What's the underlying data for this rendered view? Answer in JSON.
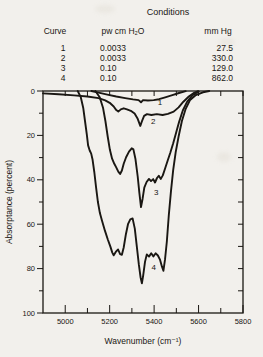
{
  "table": {
    "title": "Conditions",
    "headers": {
      "curve": "Curve",
      "pw": "pw cm H₂O",
      "mm_hg": "mm Hg"
    },
    "rows": [
      {
        "curve": "1",
        "pw": "0.0033",
        "mm_hg": "27.5"
      },
      {
        "curve": "2",
        "pw": "0.0033",
        "mm_hg": "330.0"
      },
      {
        "curve": "3",
        "pw": "0.10",
        "mm_hg": "129.0"
      },
      {
        "curve": "4",
        "pw": "0.10",
        "mm_hg": "862.0"
      }
    ]
  },
  "chart_data": {
    "type": "line",
    "title": "",
    "xlabel": "Wavenumber (cm⁻¹)",
    "ylabel": "Absorptance (percent)",
    "xlim": [
      4900,
      5800
    ],
    "ylim": [
      0,
      100
    ],
    "y_axis_inverted": true,
    "grid": false,
    "legend": "curve numbers annotated on plot",
    "x_ticks_major": [
      5000,
      5200,
      5400,
      5600,
      5800
    ],
    "x_ticks_minor": [
      5100,
      5300,
      5500,
      5700
    ],
    "y_ticks_major": [
      0,
      20,
      40,
      60,
      80,
      100
    ],
    "y_ticks_minor": [
      10,
      30,
      50,
      70,
      90
    ],
    "ink_color": "#1a1713",
    "series": [
      {
        "name": "1",
        "label_pos": [
          5426,
          5.0
        ],
        "points": [
          [
            5118,
            0
          ],
          [
            5150,
            0.7
          ],
          [
            5190,
            1.6
          ],
          [
            5230,
            2.5
          ],
          [
            5270,
            3.2
          ],
          [
            5305,
            3.8
          ],
          [
            5330,
            4.1
          ],
          [
            5341,
            5.1
          ],
          [
            5350,
            4.1
          ],
          [
            5372,
            4.3
          ],
          [
            5398,
            4.1
          ],
          [
            5422,
            3.7
          ],
          [
            5450,
            2.9
          ],
          [
            5482,
            1.9
          ],
          [
            5512,
            0.9
          ],
          [
            5542,
            0.1
          ]
        ]
      },
      {
        "name": "2",
        "label_pos": [
          5396,
          13.6
        ],
        "points": [
          [
            4900,
            1.1
          ],
          [
            4970,
            1.5
          ],
          [
            5040,
            2.0
          ],
          [
            5100,
            2.5
          ],
          [
            5150,
            3.2
          ],
          [
            5180,
            4.2
          ],
          [
            5200,
            5.3
          ],
          [
            5218,
            7.0
          ],
          [
            5230,
            8.6
          ],
          [
            5239,
            9.3
          ],
          [
            5250,
            8.3
          ],
          [
            5263,
            7.8
          ],
          [
            5278,
            8.3
          ],
          [
            5295,
            8.9
          ],
          [
            5312,
            10.2
          ],
          [
            5326,
            12.5
          ],
          [
            5338,
            15.7
          ],
          [
            5347,
            13.2
          ],
          [
            5355,
            11.2
          ],
          [
            5368,
            10.4
          ],
          [
            5388,
            10.8
          ],
          [
            5412,
            10.4
          ],
          [
            5438,
            10.8
          ],
          [
            5462,
            10.3
          ],
          [
            5488,
            9.3
          ],
          [
            5510,
            7.4
          ],
          [
            5532,
            4.8
          ],
          [
            5556,
            2.5
          ],
          [
            5580,
            0.8
          ],
          [
            5598,
            0.1
          ]
        ]
      },
      {
        "name": "3",
        "label_pos": [
          5409,
          45.5
        ],
        "points": [
          [
            5136,
            0
          ],
          [
            5155,
            2.8
          ],
          [
            5170,
            7.5
          ],
          [
            5181,
            13.5
          ],
          [
            5191,
            20.5
          ],
          [
            5201,
            26.5
          ],
          [
            5211,
            30.5
          ],
          [
            5221,
            32.8
          ],
          [
            5229,
            34.3
          ],
          [
            5239,
            36.3
          ],
          [
            5247,
            37.4
          ],
          [
            5255,
            35.8
          ],
          [
            5263,
            32.8
          ],
          [
            5274,
            29.8
          ],
          [
            5287,
            27.3
          ],
          [
            5299,
            25.8
          ],
          [
            5307,
            26.3
          ],
          [
            5316,
            30.5
          ],
          [
            5326,
            38.5
          ],
          [
            5334,
            46
          ],
          [
            5341,
            52.3
          ],
          [
            5348,
            48.5
          ],
          [
            5356,
            43.5
          ],
          [
            5366,
            41
          ],
          [
            5377,
            39.6
          ],
          [
            5386,
            40.6
          ],
          [
            5396,
            39.7
          ],
          [
            5404,
            41.2
          ],
          [
            5413,
            39.2
          ],
          [
            5421,
            38.2
          ],
          [
            5430,
            39.6
          ],
          [
            5439,
            38
          ],
          [
            5449,
            35
          ],
          [
            5461,
            31.3
          ],
          [
            5473,
            27.8
          ],
          [
            5486,
            23.5
          ],
          [
            5499,
            18.8
          ],
          [
            5513,
            13.8
          ],
          [
            5529,
            8.8
          ],
          [
            5549,
            4.8
          ],
          [
            5573,
            1.9
          ],
          [
            5601,
            0.2
          ]
        ]
      },
      {
        "name": "4",
        "label_pos": [
          5398,
          79.5
        ],
        "points": [
          [
            5056,
            0
          ],
          [
            5070,
            2.8
          ],
          [
            5081,
            7.5
          ],
          [
            5089,
            13.5
          ],
          [
            5097,
            19.5
          ],
          [
            5103,
            24.5
          ],
          [
            5110,
            26.8
          ],
          [
            5117,
            28.2
          ],
          [
            5123,
            31
          ],
          [
            5131,
            36.5
          ],
          [
            5139,
            43.5
          ],
          [
            5147,
            50
          ],
          [
            5156,
            55
          ],
          [
            5166,
            58.5
          ],
          [
            5179,
            63
          ],
          [
            5192,
            67
          ],
          [
            5203,
            70
          ],
          [
            5212,
            72.8
          ],
          [
            5218,
            74
          ],
          [
            5228,
            72.4
          ],
          [
            5238,
            71.4
          ],
          [
            5247,
            73.5
          ],
          [
            5255,
            73.8
          ],
          [
            5263,
            70.5
          ],
          [
            5273,
            64.5
          ],
          [
            5283,
            59.8
          ],
          [
            5293,
            57.8
          ],
          [
            5303,
            57.4
          ],
          [
            5313,
            62
          ],
          [
            5322,
            70
          ],
          [
            5331,
            78
          ],
          [
            5339,
            84
          ],
          [
            5345,
            86.6
          ],
          [
            5351,
            83
          ],
          [
            5359,
            77
          ],
          [
            5367,
            73.6
          ],
          [
            5377,
            74.6
          ],
          [
            5387,
            73.1
          ],
          [
            5397,
            74.5
          ],
          [
            5407,
            73.1
          ],
          [
            5417,
            74.1
          ],
          [
            5427,
            76.1
          ],
          [
            5435,
            79
          ],
          [
            5442,
            81
          ],
          [
            5449,
            76
          ],
          [
            5457,
            68
          ],
          [
            5466,
            56
          ],
          [
            5476,
            45
          ],
          [
            5486,
            35.5
          ],
          [
            5497,
            27.5
          ],
          [
            5510,
            20.5
          ],
          [
            5525,
            13.5
          ],
          [
            5542,
            8
          ],
          [
            5562,
            4
          ],
          [
            5588,
            1.8
          ],
          [
            5620,
            0.6
          ],
          [
            5648,
            0
          ]
        ]
      }
    ]
  }
}
